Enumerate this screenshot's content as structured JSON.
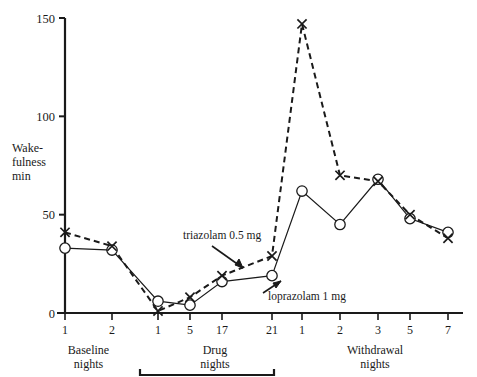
{
  "chart_data": {
    "type": "line",
    "title": "",
    "xlabel": "",
    "ylabel": "Wake-fulness min",
    "ylabel_lines": [
      "Wake-",
      "fulness",
      "min"
    ],
    "ylim": [
      0,
      150
    ],
    "yticks": [
      0,
      50,
      100,
      150
    ],
    "ytick_labels": [
      "0",
      "50",
      "100",
      "150"
    ],
    "grid": false,
    "legend_position": "none",
    "x_index": [
      0,
      1,
      2,
      3,
      4,
      5,
      6,
      7,
      8,
      9,
      10
    ],
    "categories": [
      "1",
      "2",
      "1",
      "5",
      "17",
      "21",
      "1",
      "2",
      "3",
      "5",
      "7"
    ],
    "x_groups": [
      {
        "label_lines": [
          "Baseline",
          "nights"
        ],
        "label": "Baseline nights",
        "from_index": 0,
        "to_index": 1,
        "bracket": false
      },
      {
        "label_lines": [
          "Drug",
          "nights"
        ],
        "label": "Drug nights",
        "from_index": 2,
        "to_index": 5,
        "bracket": true
      },
      {
        "label_lines": [
          "Withdrawal",
          "nights"
        ],
        "label": "Withdrawal nights",
        "from_index": 6,
        "to_index": 10,
        "bracket": false
      }
    ],
    "series": [
      {
        "name": "loprazolam 1 mg",
        "marker": "circle",
        "line_style": "solid",
        "color": "#1a1a1a",
        "values": [
          33,
          32,
          6,
          4,
          16,
          19,
          62,
          45,
          68,
          48,
          41
        ]
      },
      {
        "name": "triazolam 0.5 mg",
        "marker": "x",
        "line_style": "dashed",
        "color": "#1a1a1a",
        "values": [
          41,
          34,
          1,
          8,
          19,
          29,
          147,
          70,
          67,
          50,
          38
        ]
      }
    ],
    "annotations": [
      {
        "text": "triazolam 0.5 mg",
        "target_index": 5,
        "target_series": "triazolam 0.5 mg",
        "target_value": 29
      },
      {
        "text": "loprazolam 1 mg",
        "target_index": 5,
        "target_series": "loprazolam 1 mg",
        "target_value": 19
      }
    ]
  }
}
